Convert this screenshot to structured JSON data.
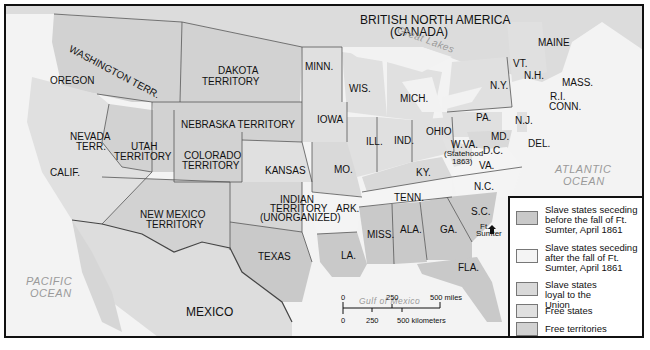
{
  "map": {
    "regions": {
      "british_north_america": "BRITISH NORTH AMERICA",
      "canada": "(CANADA)",
      "mexico": "MEXICO"
    },
    "water": {
      "great_lakes": "Great Lakes",
      "pacific_1": "PACIFIC",
      "pacific_2": "OCEAN",
      "atlantic_1": "ATLANTIC",
      "atlantic_2": "OCEAN",
      "gulf": "Gulf of Mexico"
    },
    "labels": {
      "washington": "WASHINGTON TERR.",
      "oregon": "OREGON",
      "dakota_1": "DAKOTA",
      "dakota_2": "TERRITORY",
      "minn": "MINN.",
      "wis": "WIS.",
      "mich": "MICH.",
      "iowa": "IOWA",
      "nebraska": "NEBRASKA TERRITORY",
      "nevada_1": "NEVADA",
      "nevada_2": "TERR.",
      "utah_1": "UTAH",
      "utah_2": "TERRITORY",
      "colorado_1": "COLORADO",
      "colorado_2": "TERRITORY",
      "calif": "CALIF.",
      "kansas": "KANSAS",
      "ill": "ILL.",
      "ind": "IND.",
      "ohio": "OHIO",
      "mo": "MO.",
      "ky": "KY.",
      "new_mexico_1": "NEW MEXICO",
      "new_mexico_2": "TERRITORY",
      "indian_1": "INDIAN",
      "indian_2": "TERRITORY",
      "indian_3": "(UNORGANIZED)",
      "ark": "ARK.",
      "tenn": "TENN.",
      "texas": "TEXAS",
      "la": "LA.",
      "miss": "MISS.",
      "ala": "ALA.",
      "ga": "GA.",
      "sc": "S.C.",
      "nc": "N.C.",
      "va": "VA.",
      "wva_1": "W.VA.",
      "wva_2": "(Statehood",
      "wva_3": "1863)",
      "md": "MD.",
      "dc": "D.C.",
      "del": "DEL.",
      "nj": "N.J.",
      "pa": "PA.",
      "ny": "N.Y.",
      "vt": "VT.",
      "nh": "N.H.",
      "maine": "MAINE",
      "mass": "MASS.",
      "ri": "R.I.",
      "conn": "CONN.",
      "fla": "FLA.",
      "ft_sumter_1": "Ft.",
      "ft_sumter_2": "Sumter"
    },
    "scale": {
      "miles_0": "0",
      "miles_250": "250",
      "miles_500": "500 miles",
      "km_0": "0",
      "km_250": "250",
      "km_500": "500 kilometers"
    }
  },
  "legend": {
    "items": [
      {
        "label": "Slave states seceding before the fall of Ft. Sumter, April 1861",
        "color": "#c9c9c9"
      },
      {
        "label": "Slave states seceding after the fall of Ft. Sumter, April 1861",
        "color": "#f4f4f4"
      },
      {
        "label": "Slave states loyal to the Union",
        "color": "#d9d9d9"
      },
      {
        "label": "Free states",
        "color": "#e0e0e0"
      },
      {
        "label": "Free territories",
        "color": "#d2d2d2"
      }
    ]
  },
  "colors": {
    "ocean": "#f3f3f3",
    "land_foreign": "#dedede",
    "secede_before": "#c9c9c9",
    "secede_after": "#f4f4f4",
    "loyal_slave": "#d9d9d9",
    "free_state": "#e0e0e0",
    "free_territory": "#d2d2d2",
    "border": "#555555"
  }
}
